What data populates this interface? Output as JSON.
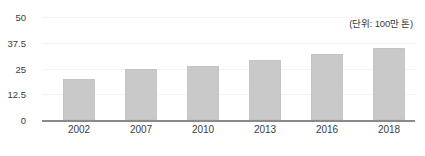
{
  "chart_data": {
    "type": "bar",
    "title": "",
    "subtitle": "",
    "xlabel": "",
    "ylabel": "",
    "annotation": "(단위: 100만 톤)",
    "categories": [
      "2002",
      "2007",
      "2010",
      "2013",
      "2016",
      "2018"
    ],
    "values": [
      20,
      25,
      26,
      29,
      32,
      35
    ],
    "series": [
      {
        "name": "",
        "values": [
          20,
          25,
          26,
          29,
          32,
          35
        ]
      }
    ],
    "ylim": [
      0,
      50
    ],
    "yticks": [
      "0",
      "12.5",
      "25",
      "37.5",
      "50"
    ],
    "ytick_values": [
      0,
      12.5,
      25,
      37.5,
      50
    ],
    "grid": true,
    "legend": "none",
    "bar_color": "#c9c9c9",
    "axis_color": "#8a8a8a",
    "grid_color": "#f4f4f4",
    "text_color": "#3b3b3b"
  }
}
